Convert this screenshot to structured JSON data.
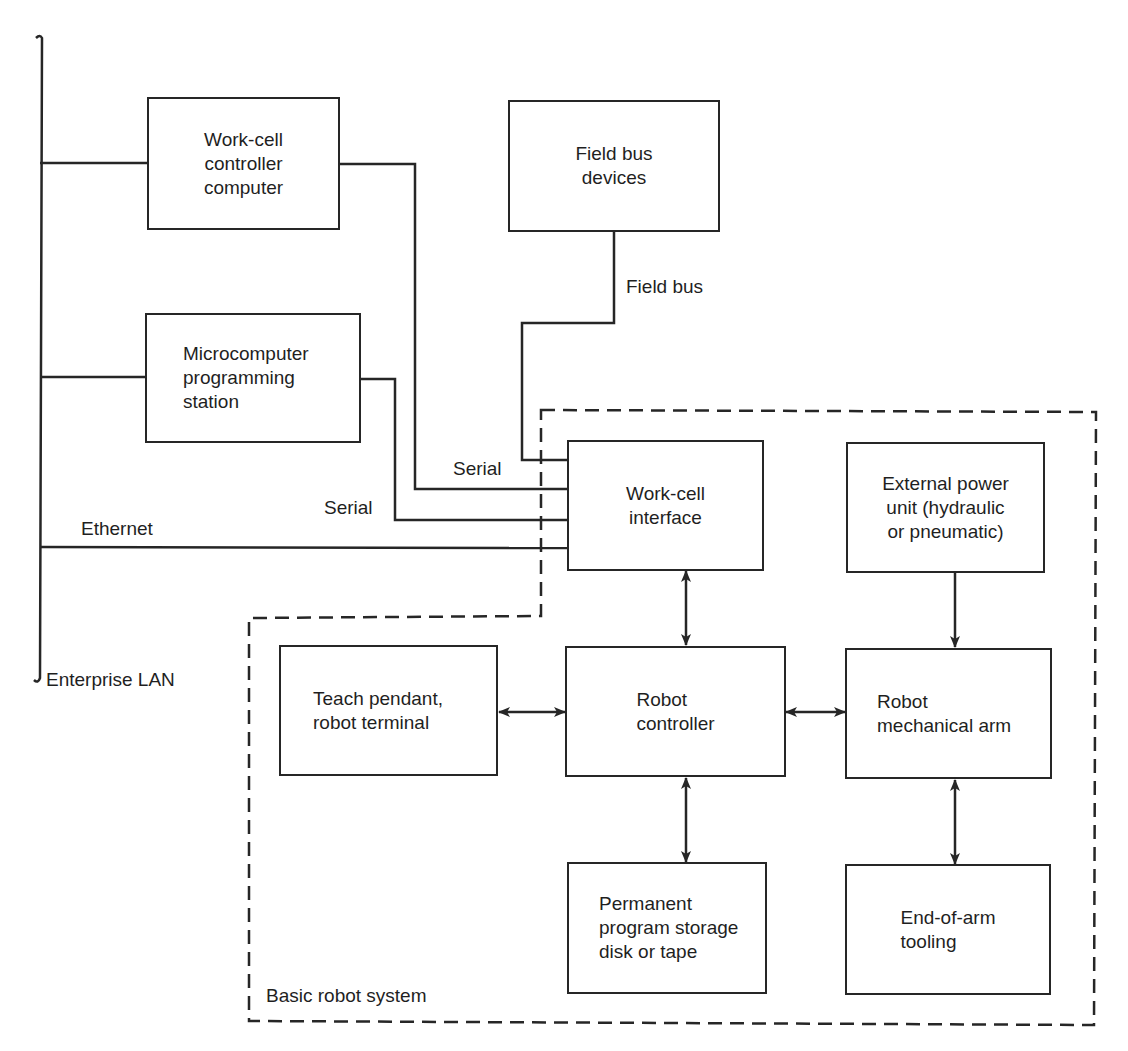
{
  "diagram": {
    "type": "block-diagram",
    "boxes": [
      {
        "id": "workcell_controller",
        "label": "Work-cell\ncontroller\ncomputer"
      },
      {
        "id": "field_bus_devices",
        "label": "Field bus\ndevices"
      },
      {
        "id": "micro_station",
        "label": "Microcomputer\nprogramming\nstation"
      },
      {
        "id": "workcell_interface",
        "label": "Work-cell\ninterface"
      },
      {
        "id": "external_power",
        "label": "External power\nunit (hydraulic\nor pneumatic)"
      },
      {
        "id": "teach_pendant",
        "label": "Teach pendant,\nrobot terminal"
      },
      {
        "id": "robot_controller",
        "label": "Robot\ncontroller"
      },
      {
        "id": "robot_arm",
        "label": "Robot\nmechanical arm"
      },
      {
        "id": "program_storage",
        "label": "Permanent\nprogram storage\ndisk or tape"
      },
      {
        "id": "end_of_arm",
        "label": "End-of-arm\ntooling"
      }
    ],
    "connection_labels": {
      "field_bus": "Field bus",
      "serial_1": "Serial",
      "serial_2": "Serial",
      "ethernet": "Ethernet",
      "lan": "Enterprise LAN"
    },
    "group": {
      "label": "Basic robot system",
      "style": "dashed"
    },
    "edges": [
      {
        "from": "Enterprise LAN",
        "to": "workcell_controller",
        "type": "line"
      },
      {
        "from": "Enterprise LAN",
        "to": "micro_station",
        "type": "line"
      },
      {
        "from": "Enterprise LAN",
        "to": "workcell_interface",
        "type": "line",
        "label": "Ethernet"
      },
      {
        "from": "workcell_controller",
        "to": "workcell_interface",
        "type": "line",
        "label": "Serial"
      },
      {
        "from": "micro_station",
        "to": "workcell_interface",
        "type": "line",
        "label": "Serial"
      },
      {
        "from": "field_bus_devices",
        "to": "workcell_interface",
        "type": "line",
        "label": "Field bus"
      },
      {
        "from": "workcell_interface",
        "to": "robot_controller",
        "type": "bidirectional"
      },
      {
        "from": "external_power",
        "to": "robot_arm",
        "type": "directed"
      },
      {
        "from": "teach_pendant",
        "to": "robot_controller",
        "type": "bidirectional"
      },
      {
        "from": "robot_controller",
        "to": "robot_arm",
        "type": "bidirectional"
      },
      {
        "from": "robot_controller",
        "to": "program_storage",
        "type": "bidirectional"
      },
      {
        "from": "robot_arm",
        "to": "end_of_arm",
        "type": "bidirectional"
      }
    ],
    "colors": {
      "line": "#262626",
      "background": "#ffffff"
    }
  }
}
